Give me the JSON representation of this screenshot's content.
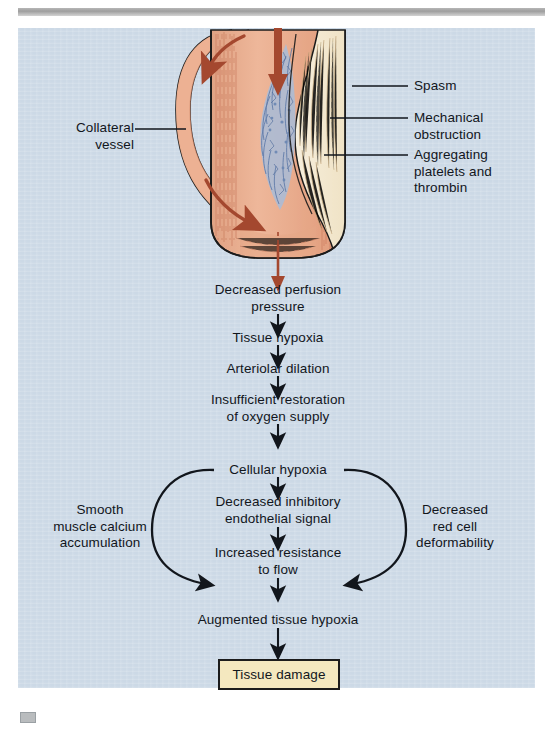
{
  "figure": {
    "background_color": "#ccd9e6",
    "illustration": {
      "name": "coronary-artery-occlusion-cross-section",
      "vessel_wall_color": "#e8a882",
      "lumen_color": "#edb496",
      "plaque_color": "#f2e7ce",
      "thrombus_color": "#9fb4d4",
      "flow_arrow_color": "#a4482f",
      "outline_color": "#1b1b1b"
    },
    "callouts": [
      {
        "id": "collateral-vessel",
        "text": "Collateral\nvessel",
        "side": "left"
      },
      {
        "id": "spasm",
        "text": "Spasm",
        "side": "right"
      },
      {
        "id": "mechanical-obstruction",
        "text": "Mechanical\nobstruction",
        "side": "right"
      },
      {
        "id": "aggregating-platelets",
        "text": "Aggregating\nplatelets and\nthrombin",
        "side": "right"
      }
    ],
    "flow_steps": [
      {
        "id": "decreased-perfusion-pressure",
        "text": "Decreased perfusion\npressure"
      },
      {
        "id": "tissue-hypoxia",
        "text": "Tissue hypoxia"
      },
      {
        "id": "arteriolar-dilation",
        "text": "Arteriolar dilation"
      },
      {
        "id": "insufficient-restoration",
        "text": "Insufficient restoration\nof oxygen supply"
      },
      {
        "id": "cellular-hypoxia",
        "text": "Cellular hypoxia"
      },
      {
        "id": "decreased-inhibitory-signal",
        "text": "Decreased inhibitory\nendothelial signal"
      },
      {
        "id": "increased-resistance",
        "text": "Increased resistance\nto flow"
      },
      {
        "id": "augmented-tissue-hypoxia",
        "text": "Augmented tissue hypoxia"
      }
    ],
    "side_branches": {
      "left": {
        "id": "smooth-muscle-calcium",
        "text": "Smooth\nmuscle calcium\naccumulation"
      },
      "right": {
        "id": "decreased-red-cell-deformability",
        "text": "Decreased\nred cell\ndeformability"
      }
    },
    "outcome": {
      "id": "tissue-damage",
      "text": "Tissue damage",
      "fill_color": "#f4e8bf",
      "border_color": "#1c1c1c"
    }
  }
}
